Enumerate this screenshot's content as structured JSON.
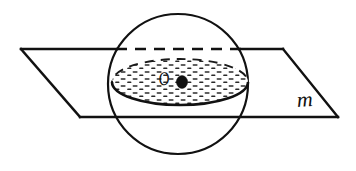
{
  "figure": {
    "kind": "geometry-diagram",
    "background_color": "#ffffff",
    "ink_color": "#111111",
    "width": 356,
    "height": 171
  },
  "labels": {
    "center_point": "O",
    "plane": "m"
  },
  "shapes": {
    "sphere": {
      "name": "sphere-outline",
      "center_x": 178,
      "center_y": 84,
      "radius": 70,
      "stroke": "#111111",
      "stroke_width": 2.2,
      "fill": "none",
      "style": "solid"
    },
    "plane": {
      "name": "plane-parallelogram",
      "points": "21,49 283,49 338,117 80,117",
      "stroke": "#111111",
      "stroke_width": 2.4,
      "fill": "none",
      "hidden_top_edge": {
        "x1": 117,
        "x2": 240,
        "y": 49,
        "style": "dashed",
        "dash_pattern": "11 8"
      }
    },
    "cross_section": {
      "name": "cross-section-ellipse",
      "center_x": 180,
      "center_y": 82,
      "radius_x": 68,
      "radius_y": 23,
      "front_arc_style": "solid",
      "front_arc_width": 2.6,
      "back_arc_style": "dashed",
      "back_arc_width": 1.9,
      "back_dash_pattern": "9 7",
      "fill_pattern": "horizontal-dash-stipple",
      "fill_color": "#ffffff",
      "stipple_color": "#2a2a2a"
    },
    "center_dot": {
      "name": "center-point-dot",
      "cx": 182,
      "cy": 82,
      "rx": 5.6,
      "ry": 6.4,
      "fill": "#111111"
    }
  }
}
